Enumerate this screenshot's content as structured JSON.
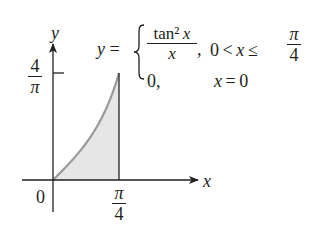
{
  "figure": {
    "axes": {
      "x_label": "x",
      "y_label": "y",
      "origin_label": "0",
      "x_tick": {
        "numerator": "π",
        "denominator": "4",
        "value": 0.7853981634
      },
      "y_tick": {
        "numerator": "4",
        "denominator": "π",
        "value": 1.2732395447
      }
    },
    "equation": {
      "lhs": "y =",
      "case1": {
        "numerator": "tan² x",
        "denominator": "x",
        "comma": ",",
        "condition_prefix": "0 < x ≤",
        "condition_frac_num": "π",
        "condition_frac_den": "4"
      },
      "case2": {
        "value": "0,",
        "condition": "x = 0"
      }
    },
    "colors": {
      "curve": "#9a9a9a",
      "fill": "#e6e6e6",
      "axes": "#231f20",
      "text": "#231f20"
    }
  },
  "chart_data": {
    "type": "area",
    "title": "",
    "function": "y = tan^2(x)/x for 0 < x <= pi/4; y = 0 at x = 0",
    "x": [
      0,
      0.0982,
      0.1963,
      0.2945,
      0.3927,
      0.4909,
      0.589,
      0.6872,
      0.7854
    ],
    "y": [
      0,
      0.0986,
      0.2001,
      0.3078,
      0.425,
      0.556,
      0.7063,
      0.8831,
      1.2732
    ],
    "shaded_region": "area under curve from x = 0 to x = π/4",
    "xlabel": "x",
    "ylabel": "y",
    "x_ticks": [
      "0",
      "π/4"
    ],
    "y_ticks": [
      "4/π"
    ],
    "xlim": [
      0,
      0.7854
    ],
    "ylim": [
      0,
      1.2732
    ],
    "grid": false,
    "legend": "none"
  }
}
